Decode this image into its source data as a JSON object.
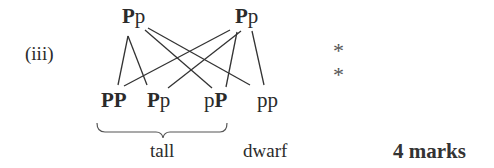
{
  "question": {
    "part_label": "(iii)",
    "parents": [
      {
        "id": "parent-left",
        "dominant": "P",
        "recessive": "p"
      },
      {
        "id": "parent-right",
        "dominant": "P",
        "recessive": "p"
      }
    ],
    "offspring": [
      {
        "first": "P",
        "first_bold": true,
        "second": "P",
        "second_bold": true
      },
      {
        "first": "P",
        "first_bold": true,
        "second": "p",
        "second_bold": false
      },
      {
        "first": "p",
        "first_bold": false,
        "second": "P",
        "second_bold": true
      },
      {
        "first": "p",
        "first_bold": false,
        "second": "p",
        "second_bold": false
      }
    ],
    "markers": [
      "*",
      "*"
    ],
    "phenotypes": {
      "tall": "tall",
      "dwarf": "dwarf"
    },
    "marks": "4 marks"
  }
}
